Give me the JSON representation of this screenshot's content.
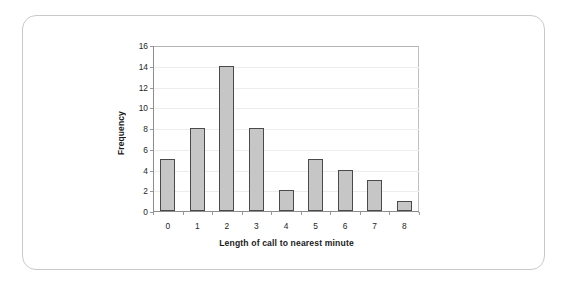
{
  "figure": {
    "frame_color": "#c9c9c9",
    "background": "#ffffff"
  },
  "chart_data": {
    "type": "bar",
    "title": "",
    "subtitle": "",
    "xlabel": "Length of call to nearest minute",
    "ylabel": "Frequency",
    "categories": [
      "0",
      "1",
      "2",
      "3",
      "4",
      "5",
      "6",
      "7",
      "8"
    ],
    "values": [
      5,
      8,
      14,
      8,
      2,
      5,
      4,
      3,
      1
    ],
    "ylim": [
      0,
      16
    ],
    "ytick_labels": [
      "0",
      "2",
      "4",
      "6",
      "8",
      "10",
      "12",
      "14",
      "16"
    ],
    "ytick_values": [
      0,
      2,
      4,
      6,
      8,
      10,
      12,
      14,
      16
    ],
    "ytick_step": 2,
    "grid": "horizontal",
    "legend": "none",
    "bar_fill": "#c6c6c6",
    "bar_edge": "#4a4a4a",
    "gridline_color": "#ededed",
    "axis_color": "#8d8d8d"
  }
}
